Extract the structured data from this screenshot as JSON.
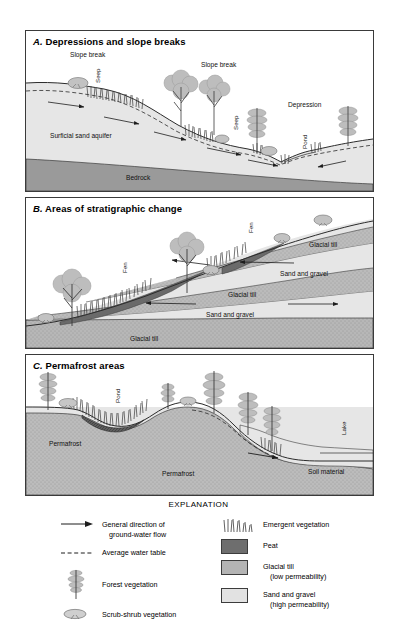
{
  "figure": {
    "panels": [
      {
        "id": "A",
        "title_letter": "A.",
        "title": "Depressions and slope breaks",
        "labels": [
          {
            "name": "slope-break-1",
            "text": "Slope break"
          },
          {
            "name": "seep-1",
            "text": "Seep"
          },
          {
            "name": "slope-break-2",
            "text": "Slope break"
          },
          {
            "name": "seep-2",
            "text": "Seep"
          },
          {
            "name": "depression",
            "text": "Depression"
          },
          {
            "name": "pond",
            "text": "Pond"
          },
          {
            "name": "surficial-sand-aquifer",
            "text": "Surficial sand aquifer"
          },
          {
            "name": "bedrock",
            "text": "Bedrock"
          }
        ]
      },
      {
        "id": "B",
        "title_letter": "B.",
        "title": "Areas of stratigraphic change",
        "labels": [
          {
            "name": "fen-1",
            "text": "Fen"
          },
          {
            "name": "fen-2",
            "text": "Fen"
          },
          {
            "name": "glacial-till-upper",
            "text": "Glacial till"
          },
          {
            "name": "sand-and-gravel-upper",
            "text": "Sand and gravel"
          },
          {
            "name": "glacial-till-middle",
            "text": "Glacial till"
          },
          {
            "name": "sand-and-gravel-lower",
            "text": "Sand and gravel"
          },
          {
            "name": "glacial-till-lower",
            "text": "Glacial till"
          }
        ]
      },
      {
        "id": "C",
        "title_letter": "C.",
        "title": "Permafrost areas",
        "labels": [
          {
            "name": "pond",
            "text": "Pond"
          },
          {
            "name": "lake",
            "text": "Lake"
          },
          {
            "name": "permafrost-left",
            "text": "Permafrost"
          },
          {
            "name": "permafrost-center",
            "text": "Permafrost"
          },
          {
            "name": "soil-material",
            "text": "Soil material"
          }
        ]
      }
    ]
  },
  "explanation": {
    "heading": "EXPLANATION",
    "left_items": [
      {
        "symbol": "flow-arrow",
        "line1": "General direction of",
        "line2": "ground-water flow"
      },
      {
        "symbol": "dashed-line",
        "line1": "Average water table",
        "line2": ""
      },
      {
        "symbol": "forest-tree",
        "line1": "Forest vegetation",
        "line2": ""
      },
      {
        "symbol": "scrub-shrub",
        "line1": "Scrub-shrub vegetation",
        "line2": ""
      }
    ],
    "right_items": [
      {
        "symbol": "emergent-grass",
        "line1": "Emergent vegetation",
        "line2": ""
      },
      {
        "symbol": "peat-swatch",
        "line1": "Peat",
        "line2": ""
      },
      {
        "symbol": "till-swatch",
        "line1": "Glacial till",
        "line2": "(low permeability)"
      },
      {
        "symbol": "sand-swatch",
        "line1": "Sand and gravel",
        "line2": "(high permeability)"
      }
    ]
  },
  "colors": {
    "peat": "#6e6e6e",
    "glacial_till": "#b4b4b4",
    "sand_gravel": "#e2e2e2",
    "bedrock": "#9a9a9a",
    "vegetation": "#b9b9b9",
    "line": "#2b2b2b"
  }
}
